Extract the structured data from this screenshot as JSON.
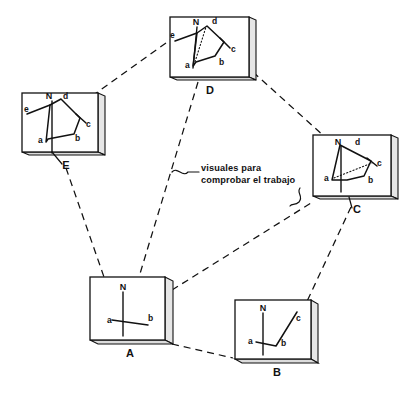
{
  "figure": {
    "annotation": {
      "line1": "visuales para",
      "line2": "comprobar el trabajo",
      "name": "check-sight-lines-note"
    },
    "ink_color": "#111111",
    "board_face_color": "#ffffff",
    "board_edge_color": "#e6e6e6",
    "background_color": "#ffffff"
  },
  "stations": [
    {
      "id": "A",
      "label": "A",
      "north_label": "N",
      "point_labels": [
        "a",
        "b"
      ],
      "has_dotted_check_line": false,
      "description": "plane table at station A with rays to a and b"
    },
    {
      "id": "B",
      "label": "B",
      "north_label": "N",
      "point_labels": [
        "a",
        "b",
        "c"
      ],
      "has_dotted_check_line": false,
      "description": "plane table at station B with rays to a, b and c"
    },
    {
      "id": "C",
      "label": "C",
      "north_label": "N",
      "point_labels": [
        "a",
        "b",
        "c",
        "d"
      ],
      "has_dotted_check_line": true,
      "description": "plane table at station C with dotted check line from a to c"
    },
    {
      "id": "D",
      "label": "D",
      "north_label": "N",
      "point_labels": [
        "a",
        "b",
        "c",
        "d",
        "e"
      ],
      "has_dotted_check_line": true,
      "description": "plane table at station D with dotted check line from a to d"
    },
    {
      "id": "E",
      "label": "E",
      "north_label": "N",
      "point_labels": [
        "a",
        "b",
        "c",
        "d",
        "e"
      ],
      "has_dotted_check_line": false,
      "description": "plane table at station E with closed pentagon a-b-c-d-e"
    }
  ],
  "sight_lines": [
    {
      "from": "E",
      "to": "D",
      "style": "dashed"
    },
    {
      "from": "D",
      "to": "C",
      "style": "dashed"
    },
    {
      "from": "E",
      "to": "A",
      "style": "dashed"
    },
    {
      "from": "D",
      "to": "A",
      "style": "dashed"
    },
    {
      "from": "A",
      "to": "C",
      "style": "dashed"
    },
    {
      "from": "A",
      "to": "B",
      "style": "dashed"
    },
    {
      "from": "C",
      "to": "B",
      "style": "dashed"
    }
  ]
}
